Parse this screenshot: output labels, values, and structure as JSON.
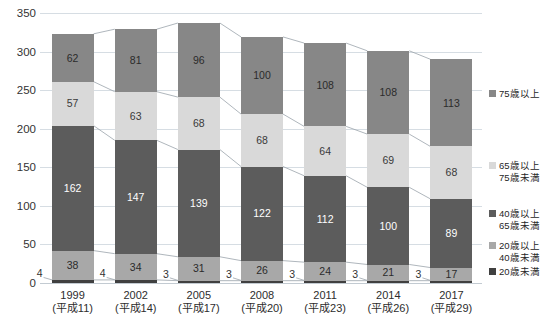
{
  "chart_data": {
    "type": "bar",
    "stacked": true,
    "title": "",
    "xlabel": "",
    "ylabel": "",
    "ylim": [
      0,
      350
    ],
    "ytick_step": 50,
    "yticks": [
      "0",
      "50",
      "100",
      "150",
      "200",
      "250",
      "300",
      "350"
    ],
    "grid": true,
    "legend_position": "right",
    "categories": [
      {
        "year": "1999",
        "era": "(平成11)"
      },
      {
        "year": "2002",
        "era": "(平成14)"
      },
      {
        "year": "2005",
        "era": "(平成17)"
      },
      {
        "year": "2008",
        "era": "(平成20)"
      },
      {
        "year": "2011",
        "era": "(平成23)"
      },
      {
        "year": "2014",
        "era": "(平成26)"
      },
      {
        "year": "2017",
        "era": "(平成29)"
      }
    ],
    "category_labels": [
      "1999",
      "2002",
      "2005",
      "2008",
      "2011",
      "2014",
      "2017"
    ],
    "series": [
      {
        "name": "20歳未満",
        "color": "#404040",
        "values": [
          4,
          4,
          3,
          3,
          3,
          3,
          3
        ]
      },
      {
        "name": "20歳以上40歳未満",
        "color": "#a8a8a8",
        "values": [
          38,
          34,
          31,
          26,
          24,
          21,
          17
        ]
      },
      {
        "name": "40歳以上65歳未満",
        "color": "#5c5c5c",
        "values": [
          162,
          147,
          139,
          122,
          112,
          100,
          89
        ]
      },
      {
        "name": "65歳以上75歳未満",
        "color": "#d9d9d9",
        "values": [
          57,
          63,
          68,
          68,
          64,
          69,
          68
        ]
      },
      {
        "name": "75歳以上",
        "color": "#878787",
        "values": [
          62,
          81,
          96,
          100,
          108,
          108,
          113
        ]
      }
    ],
    "totals": [
      323,
      329,
      337,
      319,
      311,
      301,
      290
    ],
    "connectors": true
  },
  "legend": {
    "items": [
      {
        "label_line1": "75歳以上",
        "label_line2": "",
        "color": "#878787",
        "name": "legend-75-plus"
      },
      {
        "label_line1": "65歳以上",
        "label_line2": "75歳未満",
        "color": "#d9d9d9",
        "name": "legend-65-75"
      },
      {
        "label_line1": "40歳以上",
        "label_line2": "65歳未満",
        "color": "#5c5c5c",
        "name": "legend-40-65"
      },
      {
        "label_line1": "20歳以上",
        "label_line2": "40歳未満",
        "color": "#a8a8a8",
        "name": "legend-20-40"
      },
      {
        "label_line1": "20歳未満",
        "label_line2": "",
        "color": "#404040",
        "name": "legend-under-20"
      }
    ]
  },
  "axis": {
    "y_values": [
      "350",
      "300",
      "250",
      "200",
      "150",
      "100",
      "50",
      "0"
    ]
  },
  "colors": {
    "grid": "#d6dde3",
    "connector": "#9aa3ab",
    "text": "#2d2d2d"
  }
}
